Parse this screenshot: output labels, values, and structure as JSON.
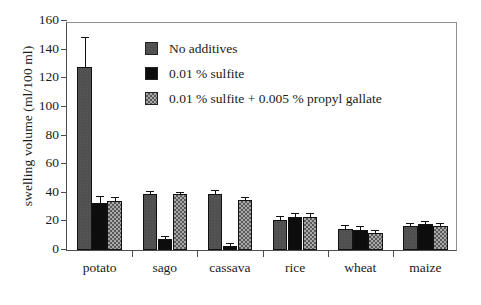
{
  "chart_data": {
    "type": "bar",
    "title": "",
    "xlabel": "",
    "ylabel": "swelling volume (ml/100 ml)",
    "ylim": [
      0,
      160
    ],
    "yticks": [
      0,
      20,
      40,
      60,
      80,
      100,
      120,
      140,
      160
    ],
    "grid": false,
    "legend_position": "upper center",
    "categories": [
      "potato",
      "sago",
      "cassava",
      "rice",
      "wheat",
      "maize"
    ],
    "series": [
      {
        "name": "No additives",
        "swatch": "solid-dark-gray",
        "color": "#4f4f4f",
        "values": [
          128,
          39,
          39,
          21,
          15,
          17
        ],
        "errors": [
          20,
          1.5,
          2,
          2,
          1.5,
          1.5
        ]
      },
      {
        "name": "0.01 % sulfite",
        "swatch": "solid-black",
        "color": "#0d0d0d",
        "values": [
          33,
          8,
          3,
          23,
          14,
          18
        ],
        "errors": [
          4,
          1,
          1,
          2,
          2,
          1.5
        ]
      },
      {
        "name": "0.01 % sulfite + 0.005 % propyl gallate",
        "swatch": "checkered-gray",
        "color": "#a8a8a8",
        "values": [
          34,
          39,
          35,
          23,
          12,
          17
        ],
        "errors": [
          2,
          1,
          1.5,
          2,
          1,
          1.5
        ]
      }
    ]
  },
  "axes": {
    "y_title": "swelling volume (ml/100 ml)",
    "y_tick_labels": [
      "0",
      "20",
      "40",
      "60",
      "80",
      "100",
      "120",
      "140",
      "160"
    ],
    "x_tick_labels": [
      "potato",
      "sago",
      "cassava",
      "rice",
      "wheat",
      "maize"
    ]
  },
  "legend": {
    "entries": [
      "No additives",
      "0.01 % sulfite",
      "0.01 % sulfite + 0.005 % propyl gallate"
    ]
  }
}
